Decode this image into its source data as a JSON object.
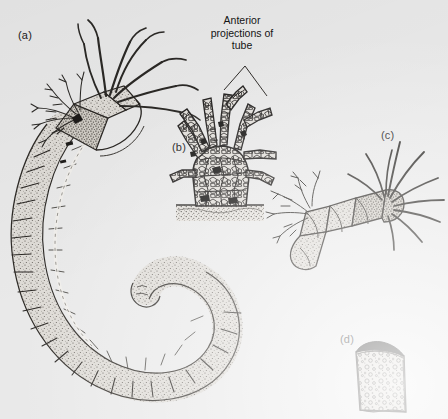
{
  "figure": {
    "background_color": "#e9e9e9",
    "ink_color": "#2b2b2b",
    "style": "stippled pen-and-ink scientific illustration"
  },
  "annotation": {
    "text": "Anterior projections of tube",
    "line1": "Anterior",
    "line2": "projections of",
    "line3": "tube"
  },
  "panels": [
    {
      "key": "a",
      "label": "(a)",
      "caption": "whole worm in curved spiral tube with branchial crown and tentacles",
      "x": 18,
      "y": 30
    },
    {
      "key": "b",
      "label": "(b)",
      "caption": "anterior end of tube showing branching projections built of cemented sand grains, set in sediment",
      "x": 172,
      "y": 142
    },
    {
      "key": "c",
      "label": "(c)",
      "caption": "enlarged anterior end of worm emerging from tube with long tentacles and branchiae",
      "x": 381,
      "y": 130
    },
    {
      "key": "d",
      "label": "(d)",
      "caption": "section of tube wall showing embedded mineral grains",
      "x": 340,
      "y": 334
    }
  ]
}
